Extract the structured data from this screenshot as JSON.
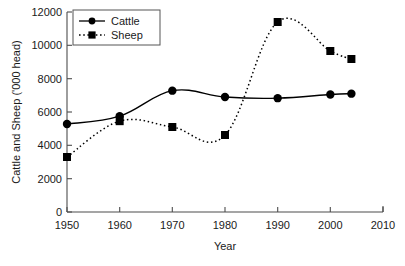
{
  "chart_data": {
    "type": "line",
    "title": "",
    "xlabel": "Year",
    "ylabel": "Cattle and Sheep ('000 head)",
    "xlim": [
      1950,
      2010
    ],
    "ylim": [
      0,
      12000
    ],
    "xticks": [
      1950,
      1960,
      1970,
      1980,
      1990,
      2000,
      2010
    ],
    "yticks": [
      0,
      2000,
      4000,
      6000,
      8000,
      10000,
      12000
    ],
    "grid": false,
    "legend_position": "top-left",
    "x": [
      1950,
      1960,
      1970,
      1980,
      1990,
      2000,
      2004
    ],
    "series": [
      {
        "name": "Cattle",
        "values": [
          5280,
          5750,
          7280,
          6900,
          6830,
          7050,
          7100
        ],
        "marker": "circle",
        "line_style": "solid",
        "color": "#000000"
      },
      {
        "name": "Sheep",
        "values": [
          3300,
          5450,
          5100,
          4620,
          11400,
          9660,
          9180
        ],
        "marker": "square",
        "line_style": "dotted",
        "color": "#000000"
      }
    ]
  },
  "axes": {
    "y_title": "Cattle and Sheep ('000 head)",
    "x_title": "Year",
    "y_tick_labels": [
      "0",
      "2000",
      "4000",
      "6000",
      "8000",
      "10000",
      "12000"
    ],
    "x_tick_labels": [
      "1950",
      "1960",
      "1970",
      "1980",
      "1990",
      "2000",
      "2010"
    ]
  },
  "legend": {
    "entries": [
      {
        "label": "Cattle"
      },
      {
        "label": "Sheep"
      }
    ]
  }
}
